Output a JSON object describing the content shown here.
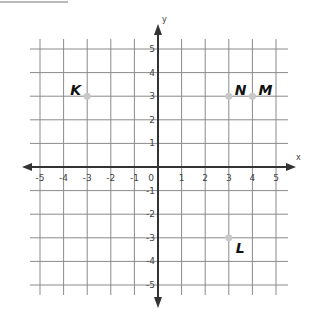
{
  "chart_data": {
    "type": "scatter",
    "title": "",
    "xlabel": "x",
    "ylabel": "y",
    "xlim": [
      -5,
      5
    ],
    "ylim": [
      -5,
      5
    ],
    "grid": true,
    "x_ticks": [
      "-5",
      "-4",
      "-3",
      "-2",
      "-1",
      "0",
      "1",
      "2",
      "3",
      "4",
      "5"
    ],
    "y_ticks": [
      "5",
      "4",
      "3",
      "2",
      "1",
      "-1",
      "-2",
      "-3",
      "-4",
      "-5"
    ],
    "points": [
      {
        "label": "K",
        "x": -3,
        "y": 3
      },
      {
        "label": "N",
        "x": 3,
        "y": 3
      },
      {
        "label": "M",
        "x": 4,
        "y": 3
      },
      {
        "label": "L",
        "x": 3,
        "y": -3
      }
    ],
    "point_color": "#c8c8c8"
  },
  "axes": {
    "x_name": "x",
    "y_name": "y"
  }
}
